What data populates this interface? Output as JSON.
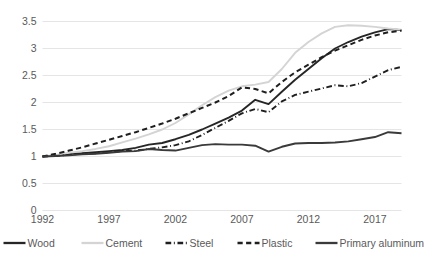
{
  "chart_data": {
    "type": "line",
    "title": "",
    "subtitle": "",
    "xlabel": "",
    "ylabel": "",
    "xlim": [
      1992,
      2019
    ],
    "ylim": [
      0,
      3.5
    ],
    "grid": true,
    "legend_position": "bottom",
    "x": [
      1992,
      1993,
      1994,
      1995,
      1996,
      1997,
      1998,
      1999,
      2000,
      2001,
      2002,
      2003,
      2004,
      2005,
      2006,
      2007,
      2008,
      2009,
      2010,
      2011,
      2012,
      2013,
      2014,
      2015,
      2016,
      2017,
      2018,
      2019
    ],
    "xticks": [
      "1992",
      "1997",
      "2002",
      "2007",
      "2012",
      "2017"
    ],
    "xtick_values": [
      1992,
      1997,
      2002,
      2007,
      2012,
      2017
    ],
    "yticks": [
      "0",
      "0.5",
      "1",
      "1.5",
      "2",
      "2.5",
      "3",
      "3.5"
    ],
    "ytick_values": [
      0,
      0.5,
      1,
      1.5,
      2,
      2.5,
      3,
      3.5
    ],
    "series": [
      {
        "name": "Wood",
        "style": "solid",
        "color": "#262626",
        "width": 1.9,
        "values": [
          1.0,
          1.02,
          1.05,
          1.06,
          1.08,
          1.1,
          1.12,
          1.16,
          1.22,
          1.25,
          1.32,
          1.4,
          1.5,
          1.61,
          1.72,
          1.85,
          2.05,
          1.97,
          2.2,
          2.42,
          2.62,
          2.82,
          3.0,
          3.12,
          3.22,
          3.3,
          3.36,
          3.34
        ]
      },
      {
        "name": "Cement",
        "style": "solid",
        "color": "#d4d4d4",
        "width": 1.9,
        "values": [
          1.0,
          1.03,
          1.07,
          1.1,
          1.14,
          1.19,
          1.26,
          1.33,
          1.41,
          1.5,
          1.62,
          1.78,
          1.95,
          2.1,
          2.22,
          2.3,
          2.33,
          2.38,
          2.62,
          2.92,
          3.12,
          3.28,
          3.4,
          3.43,
          3.42,
          3.4,
          3.37,
          3.35
        ]
      },
      {
        "name": "Steel",
        "style": "dashdot",
        "color": "#1f1f1f",
        "width": 1.9,
        "values": [
          1.0,
          1.01,
          1.03,
          1.05,
          1.06,
          1.08,
          1.1,
          1.11,
          1.14,
          1.17,
          1.21,
          1.28,
          1.4,
          1.53,
          1.66,
          1.8,
          1.88,
          1.82,
          2.02,
          2.14,
          2.2,
          2.26,
          2.32,
          2.3,
          2.36,
          2.48,
          2.6,
          2.66
        ]
      },
      {
        "name": "Plastic",
        "style": "dashed",
        "color": "#1f1f1f",
        "width": 2.0,
        "values": [
          1.0,
          1.05,
          1.11,
          1.17,
          1.24,
          1.31,
          1.38,
          1.45,
          1.53,
          1.61,
          1.7,
          1.8,
          1.9,
          2.0,
          2.12,
          2.28,
          2.25,
          2.17,
          2.38,
          2.56,
          2.7,
          2.84,
          2.96,
          3.06,
          3.16,
          3.24,
          3.3,
          3.33
        ]
      },
      {
        "name": "Primary aluminum",
        "style": "solid",
        "color": "#3a3a3a",
        "width": 1.9,
        "values": [
          1.0,
          1.01,
          1.02,
          1.04,
          1.05,
          1.07,
          1.09,
          1.1,
          1.14,
          1.12,
          1.11,
          1.16,
          1.21,
          1.23,
          1.22,
          1.22,
          1.2,
          1.09,
          1.18,
          1.24,
          1.25,
          1.25,
          1.26,
          1.28,
          1.32,
          1.36,
          1.45,
          1.43
        ]
      }
    ]
  },
  "legend": {
    "items": [
      {
        "label": "Wood"
      },
      {
        "label": "Cement"
      },
      {
        "label": "Steel"
      },
      {
        "label": "Plastic"
      },
      {
        "label": "Primary aluminum"
      }
    ]
  }
}
